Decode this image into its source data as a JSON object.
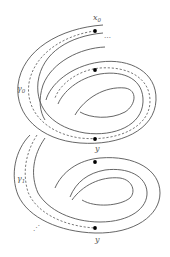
{
  "figure": {
    "type": "topological-diagram",
    "labels": {
      "x0": {
        "base": "x",
        "sub": "0"
      },
      "gamma0": {
        "base": "γ",
        "sub": "0"
      },
      "gamma1": {
        "base": "γ",
        "sub": "1"
      },
      "y_upper": "y",
      "y_lower": "y",
      "ellipsis_top": "⋯",
      "ellipsis_bottom": "⋰"
    },
    "points": [
      {
        "name": "x0",
        "x": 95,
        "y": 31
      },
      {
        "name": "upper-inner",
        "x": 95,
        "y": 70
      },
      {
        "name": "y-upper",
        "x": 95,
        "y": 139
      },
      {
        "name": "lower-inner",
        "x": 95,
        "y": 162
      },
      {
        "name": "y-lower",
        "x": 95,
        "y": 228
      }
    ],
    "colors": {
      "stroke": "#555555",
      "dot": "#000000"
    }
  }
}
